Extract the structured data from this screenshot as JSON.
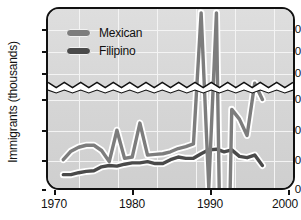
{
  "chart_data": {
    "type": "line",
    "title": "",
    "xlabel": "",
    "ylabel": "Immigrants (thousands)",
    "xlim": [
      1969,
      2001
    ],
    "xticks": [
      1970,
      1980,
      1990,
      2000
    ],
    "grid": true,
    "broken_axis": true,
    "y_lower_range": [
      0,
      150
    ],
    "y_upper_range": [
      840,
      960
    ],
    "yticks_lower": [
      0,
      50,
      100,
      150
    ],
    "yticks_upper": [
      850,
      900,
      950
    ],
    "legend_position": "top-left",
    "legend": [
      "Mexican",
      "Filipino"
    ],
    "colors": {
      "mexican": "#7d7d7d",
      "filipino": "#4a4a4a",
      "plot_background": "#d9d9d9",
      "gridline": "#f4f4f4",
      "axis": "#111111",
      "page_background": "#ffffff"
    },
    "series": [
      {
        "name": "Mexican",
        "color": "#7d7d7d",
        "x": [
          1971,
          1972,
          1973,
          1974,
          1975,
          1976,
          1977,
          1978,
          1979,
          1980,
          1981,
          1982,
          1983,
          1984,
          1985,
          1986,
          1987,
          1988,
          1989,
          1990,
          1991,
          1992,
          1993,
          1994,
          1995,
          1996,
          1997
        ],
        "values": [
          48,
          61,
          67,
          70,
          70,
          62,
          45,
          93,
          50,
          52,
          104,
          55,
          56,
          57,
          60,
          65,
          68,
          72,
          945,
          680,
          945,
          210,
          125,
          110,
          85,
          165,
          140
        ]
      },
      {
        "name": "Filipino",
        "color": "#4a4a4a",
        "x": [
          1971,
          1972,
          1973,
          1974,
          1975,
          1976,
          1977,
          1978,
          1979,
          1980,
          1981,
          1982,
          1983,
          1984,
          1985,
          1986,
          1987,
          1988,
          1989,
          1990,
          1991,
          1992,
          1993,
          1994,
          1995,
          1996,
          1997
        ],
        "values": [
          25,
          25,
          28,
          30,
          31,
          37,
          39,
          38,
          41,
          43,
          43,
          45,
          42,
          42,
          48,
          52,
          50,
          50,
          57,
          63,
          64,
          60,
          63,
          53,
          51,
          55,
          39
        ]
      }
    ]
  },
  "axis": {
    "y_title": "Immigrants (thousands)",
    "y_labels_upper": [
      "950",
      "900",
      "850"
    ],
    "y_labels_lower": [
      "150",
      "100",
      "50",
      "0"
    ],
    "x_labels": [
      "1970",
      "1980",
      "1990",
      "2000"
    ]
  },
  "legend": {
    "items": [
      {
        "label": "Mexican",
        "color": "#7d7d7d"
      },
      {
        "label": "Filipino",
        "color": "#4a4a4a"
      }
    ]
  }
}
